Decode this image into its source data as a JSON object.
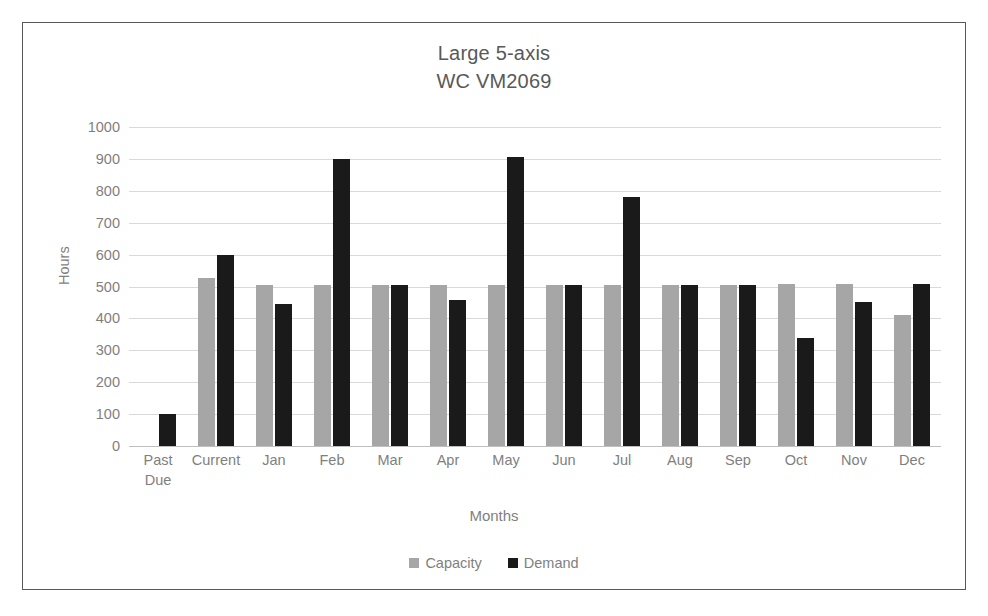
{
  "chart_data": {
    "type": "bar",
    "title": "Large 5-axis WC VM2069",
    "title_lines": [
      "Large 5-axis",
      "WC VM2069"
    ],
    "xlabel": "Months",
    "ylabel": "Hours",
    "ylim": [
      0,
      1000
    ],
    "ytick_step": 100,
    "yticks": [
      "1000",
      "900",
      "800",
      "700",
      "600",
      "500",
      "400",
      "300",
      "200",
      "100",
      "0"
    ],
    "grid": true,
    "legend_position": "bottom",
    "categories": [
      "Past Due",
      "Current",
      "Jan",
      "Feb",
      "Mar",
      "Apr",
      "May",
      "Jun",
      "Jul",
      "Aug",
      "Sep",
      "Oct",
      "Nov",
      "Dec"
    ],
    "category_lines": [
      [
        "Past",
        "Due"
      ],
      [
        "Current"
      ],
      [
        "Jan"
      ],
      [
        "Feb"
      ],
      [
        "Mar"
      ],
      [
        "Apr"
      ],
      [
        "May"
      ],
      [
        "Jun"
      ],
      [
        "Jul"
      ],
      [
        "Aug"
      ],
      [
        "Sep"
      ],
      [
        "Oct"
      ],
      [
        "Nov"
      ],
      [
        "Dec"
      ]
    ],
    "series": [
      {
        "name": "Capacity",
        "color": "#a6a6a6",
        "values": [
          0,
          527,
          505,
          505,
          505,
          505,
          505,
          505,
          505,
          505,
          505,
          507,
          508,
          410
        ]
      },
      {
        "name": "Demand",
        "color": "#1a1a1a",
        "values": [
          100,
          600,
          445,
          900,
          505,
          458,
          905,
          505,
          780,
          505,
          505,
          340,
          452,
          508
        ]
      }
    ]
  },
  "legend": {
    "items": [
      {
        "label": "Capacity",
        "color": "#a6a6a6"
      },
      {
        "label": "Demand",
        "color": "#1a1a1a"
      }
    ]
  },
  "colors": {
    "capacity": "#a6a6a6",
    "demand": "#1a1a1a",
    "gridline": "#d9d9d9",
    "text": "#7f7f7f",
    "title_text": "#595959",
    "frame_border": "#595959"
  }
}
